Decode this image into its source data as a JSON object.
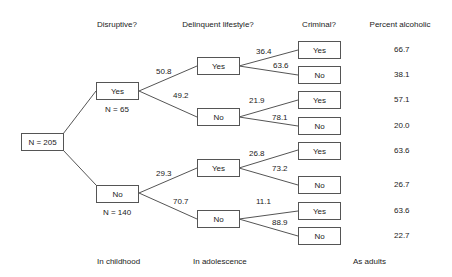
{
  "headers": {
    "disruptive": "Disruptive?",
    "delinquent": "Delinquent lifestyle?",
    "criminal": "Criminal?",
    "percent": "Percent alcoholic"
  },
  "footers": {
    "childhood": "In childhood",
    "adolescence": "In adolescence",
    "adults": "As adults"
  },
  "root": {
    "label": "N = 205"
  },
  "disruptive": {
    "yes": {
      "label": "Yes",
      "n": "N = 65"
    },
    "no": {
      "label": "No",
      "n": "N = 140"
    }
  },
  "delinquent": [
    {
      "label": "Yes",
      "pct": "50.8"
    },
    {
      "label": "No",
      "pct": "49.2"
    },
    {
      "label": "Yes",
      "pct": "29.3"
    },
    {
      "label": "No",
      "pct": "70.7"
    }
  ],
  "criminal": [
    {
      "label": "Yes",
      "pct": "36.4",
      "alcoholic": "66.7"
    },
    {
      "label": "No",
      "pct": "63.6",
      "alcoholic": "38.1"
    },
    {
      "label": "Yes",
      "pct": "21.9",
      "alcoholic": "57.1"
    },
    {
      "label": "No",
      "pct": "78.1",
      "alcoholic": "20.0"
    },
    {
      "label": "Yes",
      "pct": "26.8",
      "alcoholic": "63.6"
    },
    {
      "label": "No",
      "pct": "73.2",
      "alcoholic": "26.7"
    },
    {
      "label": "Yes",
      "pct": "11.1",
      "alcoholic": "63.6"
    },
    {
      "label": "No",
      "pct": "88.9",
      "alcoholic": "22.7"
    }
  ]
}
